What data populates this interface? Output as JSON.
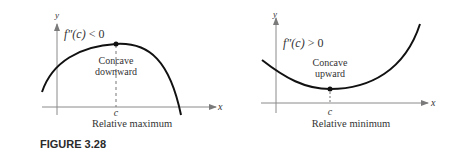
{
  "figure": {
    "caption": "FIGURE 3.28",
    "colors": {
      "curve": "#111111",
      "axis": "#7a7a7a",
      "text": "#333333"
    }
  },
  "panels": [
    {
      "id": "left",
      "axis_labels": {
        "x": "x",
        "y": "y"
      },
      "condition": {
        "prefix": "f″(c) ",
        "operator": "<",
        "value": " 0"
      },
      "concavity": [
        "Concave",
        "downward"
      ],
      "point_label": "c",
      "extremum_label": "Relative maximum"
    },
    {
      "id": "right",
      "axis_labels": {
        "x": "x",
        "y": "y"
      },
      "condition": {
        "prefix": "f″(c) ",
        "operator": ">",
        "value": " 0"
      },
      "concavity": [
        "Concave",
        "upward"
      ],
      "point_label": "c",
      "extremum_label": "Relative minimum"
    }
  ]
}
